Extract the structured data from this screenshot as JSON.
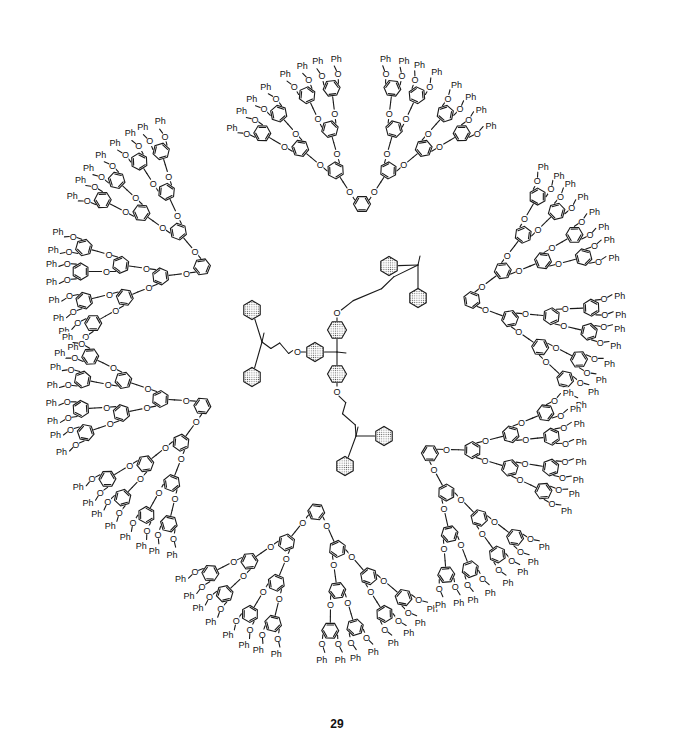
{
  "figure": {
    "compound_label": "29",
    "atom_labels": {
      "oxygen": "O",
      "terminal_group": "Ph"
    },
    "core": {
      "type": "1,1,1-tris(4-oxyphenyl)ethane",
      "shaded_aromatic_rings": true
    },
    "arms": [
      {
        "name": "upper-right",
        "dendrons": [
          "top",
          "right-upper"
        ]
      },
      {
        "name": "left",
        "dendrons": [
          "upper-left",
          "lower-left"
        ]
      },
      {
        "name": "lower-right",
        "dendrons": [
          "bottom",
          "right-lower"
        ]
      }
    ],
    "dendron_generation": 4,
    "dendron_count": 6
  }
}
